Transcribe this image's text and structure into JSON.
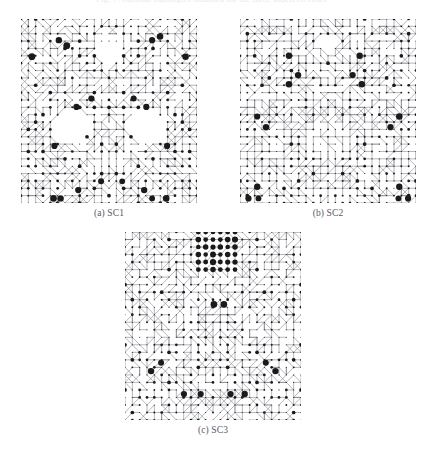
{
  "figure": {
    "cropped_header_text": "Fig. 7. Optimal topologies obtained for the three supercell cases",
    "background_color": "#ffffff",
    "node_color": "#1a1a1a",
    "edge_color": "#8a8a92",
    "caption_color": "#59595f"
  },
  "panels": [
    {
      "id": "sc1",
      "caption": "(a) SC1",
      "name": "SC1",
      "x": 21,
      "y": 19,
      "w": 176,
      "h": 184,
      "cols": 24,
      "rows": 25,
      "seed": 1734,
      "edge_density": 0.5,
      "diag_density": 0.34,
      "voids": [
        {
          "cx": 0.285,
          "cy": 0.59,
          "rx": 0.105,
          "ry": 0.085
        },
        {
          "cx": 0.715,
          "cy": 0.59,
          "rx": 0.105,
          "ry": 0.085
        },
        {
          "cx": 0.5,
          "cy": 0.185,
          "rx": 0.055,
          "ry": 0.055
        }
      ],
      "large_nodes": [
        {
          "cx": 0.215,
          "cy": 0.115,
          "r": 3.2
        },
        {
          "cx": 0.26,
          "cy": 0.145,
          "r": 3.4
        },
        {
          "cx": 0.745,
          "cy": 0.115,
          "r": 3.1
        },
        {
          "cx": 0.79,
          "cy": 0.095,
          "r": 3.3
        },
        {
          "cx": 0.062,
          "cy": 0.205,
          "r": 3.4
        },
        {
          "cx": 0.935,
          "cy": 0.205,
          "r": 3.3
        },
        {
          "cx": 0.4,
          "cy": 0.432,
          "r": 3.1
        },
        {
          "cx": 0.64,
          "cy": 0.432,
          "r": 3.0
        },
        {
          "cx": 0.315,
          "cy": 0.478,
          "r": 3.1
        },
        {
          "cx": 0.712,
          "cy": 0.478,
          "r": 3.1
        },
        {
          "cx": 0.19,
          "cy": 0.69,
          "r": 3.1
        },
        {
          "cx": 0.83,
          "cy": 0.69,
          "r": 3.1
        },
        {
          "cx": 0.455,
          "cy": 0.882,
          "r": 3.0
        },
        {
          "cx": 0.575,
          "cy": 0.882,
          "r": 2.9
        },
        {
          "cx": 0.325,
          "cy": 0.93,
          "r": 3.1
        },
        {
          "cx": 0.7,
          "cy": 0.93,
          "r": 3.2
        },
        {
          "cx": 0.185,
          "cy": 0.975,
          "r": 3.3
        },
        {
          "cx": 0.225,
          "cy": 0.975,
          "r": 3.2
        },
        {
          "cx": 0.825,
          "cy": 0.975,
          "r": 3.3
        },
        {
          "cx": 0.745,
          "cy": 0.975,
          "r": 2.9
        }
      ]
    },
    {
      "id": "sc2",
      "caption": "(b) SC2",
      "name": "SC2",
      "x": 240,
      "y": 19,
      "w": 176,
      "h": 184,
      "cols": 24,
      "rows": 25,
      "seed": 9021,
      "edge_density": 0.55,
      "diag_density": 0.3,
      "voids": [
        {
          "cx": 0.5,
          "cy": 0.135,
          "rx": 0.045,
          "ry": 0.045
        }
      ],
      "large_nodes": [
        {
          "cx": 0.278,
          "cy": 0.2,
          "r": 3.2
        },
        {
          "cx": 0.68,
          "cy": 0.2,
          "r": 3.2
        },
        {
          "cx": 0.33,
          "cy": 0.305,
          "r": 3.2
        },
        {
          "cx": 0.64,
          "cy": 0.305,
          "r": 3.1
        },
        {
          "cx": 0.278,
          "cy": 0.355,
          "r": 3.3
        },
        {
          "cx": 0.692,
          "cy": 0.355,
          "r": 3.3
        },
        {
          "cx": 0.098,
          "cy": 0.53,
          "r": 3.1
        },
        {
          "cx": 0.905,
          "cy": 0.53,
          "r": 3.3
        },
        {
          "cx": 0.148,
          "cy": 0.588,
          "r": 3.2
        },
        {
          "cx": 0.855,
          "cy": 0.588,
          "r": 3.1
        },
        {
          "cx": 0.098,
          "cy": 0.912,
          "r": 3.2
        },
        {
          "cx": 0.905,
          "cy": 0.912,
          "r": 3.2
        },
        {
          "cx": 0.048,
          "cy": 0.975,
          "r": 3.1
        },
        {
          "cx": 0.955,
          "cy": 0.975,
          "r": 3.1
        },
        {
          "cx": 0.105,
          "cy": 0.975,
          "r": 2.9
        },
        {
          "cx": 0.9,
          "cy": 0.975,
          "r": 2.9
        }
      ]
    },
    {
      "id": "sc3",
      "caption": "(c) SC3",
      "name": "SC3",
      "x": 125,
      "y": 232,
      "w": 176,
      "h": 188,
      "cols": 24,
      "rows": 25,
      "seed": 4477,
      "edge_density": 0.52,
      "diag_density": 0.36,
      "voids": [],
      "cluster": {
        "x0": 0.4,
        "y0": 0.015,
        "x1": 0.625,
        "y1": 0.195,
        "r": 3.1
      },
      "large_nodes": [
        {
          "cx": 0.505,
          "cy": 0.385,
          "r": 3.3
        },
        {
          "cx": 0.562,
          "cy": 0.385,
          "r": 3.3
        },
        {
          "cx": 0.205,
          "cy": 0.695,
          "r": 3.0
        },
        {
          "cx": 0.148,
          "cy": 0.74,
          "r": 3.2
        },
        {
          "cx": 0.8,
          "cy": 0.695,
          "r": 3.0
        },
        {
          "cx": 0.855,
          "cy": 0.74,
          "r": 3.2
        },
        {
          "cx": 0.335,
          "cy": 0.862,
          "r": 3.1
        },
        {
          "cx": 0.43,
          "cy": 0.862,
          "r": 3.1
        },
        {
          "cx": 0.6,
          "cy": 0.862,
          "r": 3.1
        },
        {
          "cx": 0.68,
          "cy": 0.862,
          "r": 3.2
        }
      ]
    }
  ]
}
